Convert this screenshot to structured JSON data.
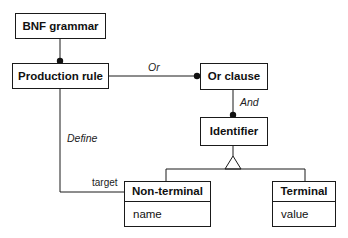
{
  "diagram": {
    "classes": {
      "bnf_grammar": {
        "name": "BNF grammar"
      },
      "production_rule": {
        "name": "Production rule"
      },
      "or_clause": {
        "name": "Or clause"
      },
      "identifier": {
        "name": "Identifier"
      },
      "non_terminal": {
        "name": "Non-terminal",
        "attributes": [
          "name"
        ]
      },
      "terminal": {
        "name": "Terminal",
        "attributes": [
          "value"
        ]
      }
    },
    "associations": {
      "or": "Or",
      "and": "And",
      "define": "Define",
      "target_role": "target"
    },
    "colors": {
      "line": "#1a1a1a",
      "background": "#ffffff"
    }
  }
}
